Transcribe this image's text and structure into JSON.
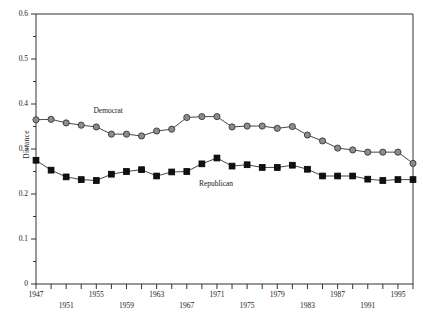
{
  "chart_data": {
    "type": "line",
    "title": "",
    "xlabel": "",
    "ylabel": "Distance",
    "ylim": [
      0,
      0.6
    ],
    "xlim": [
      1947,
      1997
    ],
    "grid": false,
    "legend_position": "inline-annotation",
    "y_tick_labels": [
      "0.6",
      "0.5",
      "0.4",
      "0.3",
      "0.2",
      "0.1",
      "0"
    ],
    "y_tick_values": [
      0.6,
      0.5,
      0.4,
      0.3,
      0.2,
      0.1,
      0
    ],
    "y_minor_tick_values": [
      0.55,
      0.45,
      0.35,
      0.25,
      0.15,
      0.05
    ],
    "x_tick_values": [
      1947,
      1949,
      1951,
      1953,
      1955,
      1957,
      1959,
      1961,
      1963,
      1965,
      1967,
      1969,
      1971,
      1973,
      1975,
      1977,
      1979,
      1981,
      1983,
      1985,
      1987,
      1989,
      1991,
      1993,
      1995,
      1997
    ],
    "x_labels_upper": [
      "1947",
      "1955",
      "1963",
      "1971",
      "1979",
      "1987",
      "1995"
    ],
    "x_labels_lower": [
      "1951",
      "1959",
      "1967",
      "1975",
      "1983",
      "1991"
    ],
    "x": [
      1947,
      1949,
      1951,
      1953,
      1955,
      1957,
      1959,
      1961,
      1963,
      1965,
      1967,
      1969,
      1971,
      1973,
      1975,
      1977,
      1979,
      1981,
      1983,
      1985,
      1987,
      1989,
      1991,
      1993,
      1995,
      1997
    ],
    "series": [
      {
        "name": "Democrat",
        "marker": "circle",
        "color": "#8c8c8c",
        "edge_color": "#2b2b2b",
        "values": [
          0.365,
          0.366,
          0.358,
          0.353,
          0.349,
          0.333,
          0.333,
          0.329,
          0.34,
          0.344,
          0.37,
          0.372,
          0.372,
          0.349,
          0.351,
          0.351,
          0.346,
          0.35,
          0.331,
          0.318,
          0.302,
          0.298,
          0.293,
          0.293,
          0.293,
          0.268
        ]
      },
      {
        "name": "Republican",
        "marker": "square",
        "color": "#111111",
        "edge_color": "#000000",
        "values": [
          0.275,
          0.253,
          0.238,
          0.232,
          0.23,
          0.244,
          0.25,
          0.254,
          0.24,
          0.249,
          0.25,
          0.267,
          0.28,
          0.262,
          0.265,
          0.259,
          0.259,
          0.264,
          0.255,
          0.24,
          0.24,
          0.24,
          0.233,
          0.23,
          0.232,
          0.232
        ]
      }
    ],
    "annotations": [
      {
        "text": "Democrat",
        "x": 1957,
        "y": 0.385
      },
      {
        "text": "Republican",
        "x": 1971,
        "y": 0.222
      }
    ]
  }
}
